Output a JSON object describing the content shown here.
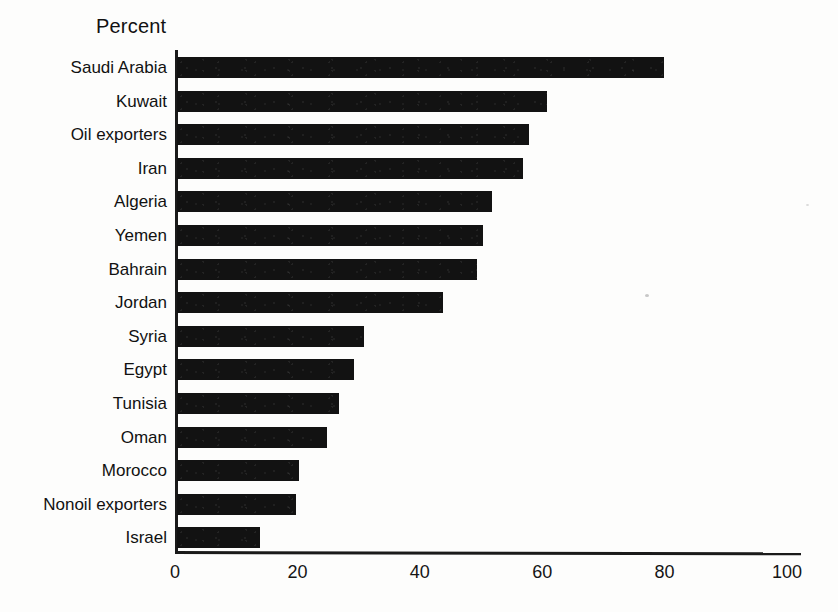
{
  "chart_data": {
    "type": "bar",
    "orientation": "horizontal",
    "title": "Percent",
    "xlabel": "",
    "ylabel": "",
    "xlim": [
      0,
      100
    ],
    "xticks": [
      0,
      20,
      40,
      60,
      80,
      100
    ],
    "grid": false,
    "legend": null,
    "bar_color": "#121212",
    "axis_color": "#1a1a1a",
    "categories": [
      "Saudi Arabia",
      "Kuwait",
      "Oil exporters",
      "Iran",
      "Algeria",
      "Yemen",
      "Bahrain",
      "Jordan",
      "Syria",
      "Egypt",
      "Tunisia",
      "Oman",
      "Morocco",
      "Nonoil exporters",
      "Israel"
    ],
    "values": [
      79.5,
      60.5,
      57.5,
      56.5,
      51.5,
      50,
      49,
      43.5,
      30.5,
      29,
      26.5,
      24.5,
      20,
      19.5,
      13.5
    ]
  }
}
